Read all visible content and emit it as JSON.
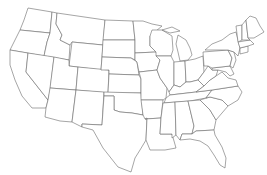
{
  "map": {
    "title": "",
    "subject": "Contiguous United States blank outline map",
    "fill_color": "#ffffff",
    "border_color": "#6a6a6a",
    "coast_color": "#333333",
    "background": "#ffffff",
    "labels": []
  }
}
